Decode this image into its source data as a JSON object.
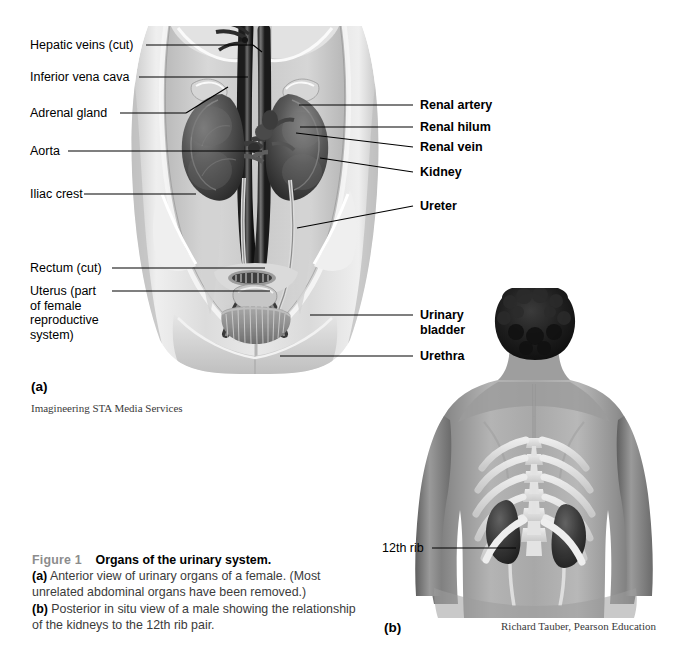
{
  "figure": {
    "panel_a_letter": "(a)",
    "panel_b_letter": "(b)",
    "panel_a_credit": "Imagineering STA Media Services",
    "panel_b_credit": "Richard Tauber, Pearson Education"
  },
  "caption": {
    "figure_number": "Figure 1",
    "title": "Organs of the urinary system.",
    "part_a_marker": "(a)",
    "part_a_text": " Anterior view of urinary organs of a female. (Most unrelated abdominal organs have been removed.)",
    "part_b_marker": "(b)",
    "part_b_text": " Posterior in situ view of a male showing the relationship of the kidneys to the 12th rib pair."
  },
  "labels_left": [
    {
      "id": "hepatic-veins",
      "text": "Hepatic veins (cut)"
    },
    {
      "id": "inferior-vena-cava",
      "text": "Inferior vena cava"
    },
    {
      "id": "adrenal-gland",
      "text": "Adrenal gland"
    },
    {
      "id": "aorta",
      "text": "Aorta"
    },
    {
      "id": "iliac-crest",
      "text": "Iliac crest"
    },
    {
      "id": "rectum",
      "text": "Rectum (cut)"
    },
    {
      "id": "uterus",
      "text": "Uterus (part\nof female\nreproductive\nsystem)"
    }
  ],
  "labels_right": [
    {
      "id": "renal-artery",
      "text": "Renal artery"
    },
    {
      "id": "renal-hilum",
      "text": "Renal hilum"
    },
    {
      "id": "renal-vein",
      "text": "Renal vein"
    },
    {
      "id": "kidney",
      "text": "Kidney"
    },
    {
      "id": "ureter",
      "text": "Ureter"
    },
    {
      "id": "urinary-bladder",
      "text": "Urinary\nbladder"
    },
    {
      "id": "urethra",
      "text": "Urethra"
    }
  ],
  "labels_panel_b": [
    {
      "id": "twelfth-rib",
      "text": "12th rib"
    }
  ],
  "colors": {
    "leader_line": "#000000",
    "caption_number": "#8c8c8c",
    "caption_body": "#3b3b3b",
    "credit_text": "#3a3a3a",
    "background": "#ffffff"
  }
}
